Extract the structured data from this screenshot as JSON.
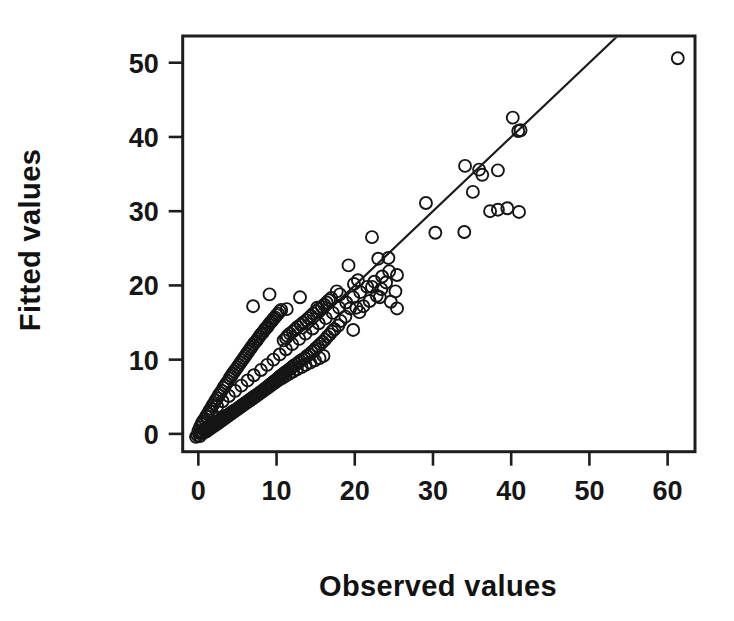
{
  "figure": {
    "background_color": "#ffffff",
    "ink_color": "#1a1a1a"
  },
  "axes": {
    "x_title": "Observed values",
    "y_title": "Fitted values",
    "x_ticks": [
      "0",
      "10",
      "20",
      "30",
      "40",
      "50",
      "60"
    ],
    "y_ticks": [
      "0",
      "10",
      "20",
      "30",
      "40",
      "50"
    ]
  },
  "chart_data": {
    "type": "scatter",
    "title": "",
    "subtitle": "",
    "xlabel": "Observed values",
    "ylabel": "Fitted values",
    "xlim": [
      -2.0,
      63.5
    ],
    "ylim": [
      -2.4,
      53.6
    ],
    "xticks": [
      0,
      10,
      20,
      30,
      40,
      50,
      60
    ],
    "yticks": [
      0,
      10,
      20,
      30,
      40,
      50
    ],
    "grid": false,
    "legend": null,
    "marker": {
      "style": "open-circle",
      "radius_px": 6,
      "fill": "none",
      "edge_color": "#151515"
    },
    "reference_line": {
      "label": "identity / fitted line",
      "type": "line",
      "slope": 1.0,
      "intercept": 0.0,
      "x_start": 13.5,
      "y_start": 13.5,
      "x_end": 53.7,
      "y_end": 53.7,
      "color": "#1d1d1d"
    },
    "series": [
      {
        "name": "Observed vs Fitted",
        "n_points": 268,
        "x": [
          61.3,
          41.2,
          40.2,
          40.9,
          38.3,
          36.3,
          35.9,
          34.1,
          35.1,
          41.0,
          39.5,
          38.3,
          37.3,
          34.0,
          30.3,
          29.1,
          25.4,
          25.4,
          25.2,
          24.3,
          23.2,
          23.0,
          22.2,
          22.2,
          20.4,
          20.2,
          19.8,
          19.2,
          18.1,
          19.9,
          17.7,
          15.2,
          13.0,
          11.3,
          9.1,
          7.0,
          24.6,
          24.0,
          23.4,
          22.8,
          21.9,
          21.1,
          20.6,
          19.4,
          18.8,
          18.2,
          17.9,
          17.4,
          17.1,
          16.8,
          16.5,
          16.2,
          15.9,
          15.6,
          15.3,
          15.0,
          14.8,
          14.5,
          14.2,
          13.9,
          13.6,
          13.3,
          13.0,
          12.8,
          12.5,
          12.2,
          12.0,
          11.8,
          11.5,
          11.3,
          11.0,
          10.8,
          10.5,
          10.3,
          10.1,
          9.9,
          9.7,
          9.5,
          9.3,
          9.1,
          8.9,
          8.7,
          8.5,
          8.3,
          8.1,
          7.9,
          7.7,
          7.5,
          7.3,
          7.1,
          6.9,
          6.7,
          6.5,
          6.3,
          6.1,
          5.9,
          5.7,
          5.5,
          5.3,
          5.1,
          4.9,
          4.7,
          4.5,
          4.3,
          4.1,
          3.9,
          3.7,
          3.5,
          3.3,
          3.1,
          2.9,
          2.7,
          2.5,
          2.3,
          2.1,
          1.9,
          1.7,
          1.5,
          1.3,
          1.1,
          0.9,
          0.7,
          0.5,
          0.3,
          0.1,
          -0.1,
          -0.3,
          0.2,
          0.4,
          0.6,
          0.8,
          1.0,
          1.2,
          1.4,
          1.6,
          1.8,
          2.0,
          2.2,
          2.4,
          2.6,
          2.8,
          3.0,
          3.2,
          3.4,
          3.6,
          3.8,
          4.0,
          4.2,
          4.4,
          4.6,
          4.8,
          5.0,
          5.2,
          5.4,
          5.6,
          5.8,
          6.0,
          6.2,
          6.4,
          6.6,
          6.8,
          7.0,
          7.2,
          7.4,
          7.6,
          7.8,
          8.0,
          8.2,
          8.4,
          8.6,
          8.8,
          9.0,
          9.2,
          9.4,
          9.6,
          9.8,
          10.0,
          10.2,
          10.4,
          10.6,
          10.9,
          11.2,
          11.4,
          11.7,
          12.1,
          12.4,
          12.7,
          13.1,
          13.4,
          13.8,
          14.1,
          14.4,
          14.7,
          15.1,
          15.4,
          15.8,
          16.1,
          16.4,
          16.7,
          17.0,
          16.0,
          15.5,
          14.9,
          14.3,
          13.7,
          13.2,
          12.6,
          12.1,
          11.6,
          11.1,
          10.7,
          10.2,
          9.8,
          9.4,
          9.0,
          8.6,
          8.2,
          7.8,
          7.4,
          7.0,
          6.6,
          6.2,
          5.8,
          5.4,
          5.0,
          4.6,
          4.2,
          3.8,
          3.4,
          3.0,
          2.6,
          2.2,
          1.8,
          1.4,
          1.0,
          0.6,
          0.2,
          0.0,
          0.5,
          1.1,
          1.7,
          2.4,
          3.1,
          3.9,
          4.7,
          5.5,
          6.3,
          7.1,
          8.0,
          8.8,
          9.6,
          10.4,
          11.2,
          12.0,
          12.9,
          13.7,
          14.6,
          15.4,
          16.3,
          17.2,
          18.0,
          18.9,
          19.8,
          20.7,
          21.6,
          22.5,
          23.5,
          24.4
        ],
        "y": [
          50.6,
          40.9,
          42.6,
          40.8,
          35.5,
          34.9,
          35.6,
          36.1,
          32.6,
          29.9,
          30.4,
          30.2,
          30.0,
          27.2,
          27.1,
          31.1,
          21.4,
          16.9,
          19.2,
          23.7,
          18.4,
          23.6,
          26.5,
          19.8,
          20.7,
          17.0,
          14.0,
          22.7,
          18.8,
          20.2,
          19.2,
          17.0,
          18.4,
          16.8,
          18.8,
          17.2,
          17.8,
          20.4,
          19.5,
          18.6,
          17.9,
          17.2,
          16.4,
          16.9,
          15.8,
          15.2,
          14.6,
          14.1,
          13.8,
          13.4,
          13.1,
          12.7,
          12.4,
          12.1,
          11.8,
          11.5,
          11.2,
          11.0,
          10.7,
          10.5,
          10.2,
          10.0,
          9.8,
          9.6,
          9.4,
          9.2,
          9.0,
          8.8,
          8.6,
          8.4,
          8.2,
          8.0,
          7.8,
          7.6,
          7.4,
          7.2,
          7.1,
          6.9,
          6.7,
          6.6,
          6.4,
          6.2,
          6.1,
          5.9,
          5.7,
          5.6,
          5.4,
          5.3,
          5.1,
          5.0,
          4.8,
          4.7,
          4.5,
          4.4,
          4.2,
          4.1,
          3.9,
          3.8,
          3.6,
          3.5,
          3.3,
          3.2,
          3.1,
          2.9,
          2.8,
          2.6,
          2.5,
          2.4,
          2.2,
          2.1,
          1.9,
          1.8,
          1.7,
          1.5,
          1.4,
          1.3,
          1.1,
          1.0,
          0.9,
          0.7,
          0.6,
          0.5,
          0.3,
          0.2,
          0.1,
          -0.2,
          -0.4,
          0.9,
          1.3,
          1.7,
          2.0,
          2.4,
          2.7,
          3.1,
          3.4,
          3.8,
          4.1,
          4.5,
          4.8,
          5.2,
          5.5,
          5.8,
          6.2,
          6.5,
          6.8,
          7.1,
          7.5,
          7.8,
          8.1,
          8.4,
          8.7,
          9.0,
          9.3,
          9.6,
          9.9,
          10.2,
          10.5,
          10.8,
          11.1,
          11.4,
          11.7,
          12.0,
          12.3,
          12.5,
          12.8,
          13.1,
          13.4,
          13.6,
          13.9,
          14.2,
          14.4,
          14.7,
          15.0,
          15.2,
          15.5,
          15.7,
          16.0,
          16.2,
          16.5,
          16.7,
          12.6,
          12.9,
          13.2,
          13.5,
          13.8,
          14.1,
          14.4,
          14.7,
          15.0,
          15.3,
          15.6,
          15.9,
          16.2,
          16.5,
          16.8,
          17.1,
          17.4,
          17.7,
          18.0,
          18.3,
          10.5,
          10.2,
          9.9,
          9.6,
          9.3,
          9.0,
          8.7,
          8.4,
          8.1,
          7.8,
          7.5,
          7.2,
          6.9,
          6.6,
          6.3,
          6.0,
          5.7,
          5.4,
          5.1,
          4.8,
          4.5,
          4.2,
          3.9,
          3.6,
          3.3,
          3.0,
          2.7,
          2.4,
          2.1,
          1.8,
          1.5,
          1.2,
          0.9,
          0.6,
          0.3,
          0.1,
          -0.3,
          0.4,
          1.5,
          2.3,
          3.0,
          3.7,
          4.4,
          5.1,
          5.8,
          6.5,
          7.2,
          7.9,
          8.6,
          9.3,
          10.0,
          10.7,
          11.4,
          12.1,
          12.8,
          13.5,
          14.2,
          14.9,
          15.6,
          16.3,
          17.0,
          17.7,
          18.4,
          19.1,
          19.8,
          20.5,
          21.2,
          21.9
        ]
      }
    ]
  }
}
